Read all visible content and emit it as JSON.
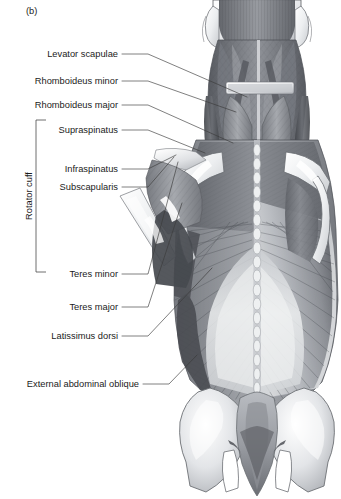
{
  "figure": {
    "panel_label": "(b)",
    "caption_region": "posterior view of superficial and deep back, shoulder and gluteal musculature",
    "background_color": "#ffffff",
    "ink_color": "#1b1b1b",
    "leader_color": "#3a3a3a"
  },
  "group_bracket": {
    "label": "Rotator cuff",
    "orientation": "vertical",
    "members": [
      "Supraspinatus",
      "Infraspinatus",
      "Subscapularis",
      "Teres minor"
    ]
  },
  "labels": [
    {
      "id": "levator-scapulae",
      "text": "Levator scapulae",
      "text_x": 118,
      "text_y": 57,
      "leader_from_x": 122,
      "leader_from_y": 54,
      "leader_to_x": 247,
      "leader_to_y": 97
    },
    {
      "id": "rhomboideus-minor",
      "text": "Rhomboideus minor",
      "text_x": 118,
      "text_y": 84,
      "leader_from_x": 122,
      "leader_from_y": 81,
      "leader_to_x": 236,
      "leader_to_y": 112
    },
    {
      "id": "rhomboideus-major",
      "text": "Rhomboideus major",
      "text_x": 118,
      "text_y": 108,
      "leader_from_x": 122,
      "leader_from_y": 105,
      "leader_to_x": 233,
      "leader_to_y": 143
    },
    {
      "id": "supraspinatus",
      "text": "Supraspinatus",
      "text_x": 118,
      "text_y": 133,
      "leader_from_x": 122,
      "leader_from_y": 130,
      "leader_to_x": 205,
      "leader_to_y": 153
    },
    {
      "id": "infraspinatus",
      "text": "Infraspinatus",
      "text_x": 118,
      "text_y": 172,
      "leader_from_x": 122,
      "leader_from_y": 169,
      "leader_to_x": 176,
      "leader_to_y": 155
    },
    {
      "id": "subscapularis",
      "text": "Subscapularis",
      "text_x": 118,
      "text_y": 190,
      "leader_from_x": 122,
      "leader_from_y": 187,
      "leader_to_x": 174,
      "leader_to_y": 157
    },
    {
      "id": "teres-minor",
      "text": "Teres minor",
      "text_x": 118,
      "text_y": 277,
      "leader_from_x": 122,
      "leader_from_y": 274,
      "leader_to_x": 178,
      "leader_to_y": 162
    },
    {
      "id": "teres-major",
      "text": "Teres major",
      "text_x": 118,
      "text_y": 310,
      "leader_from_x": 122,
      "leader_from_y": 307,
      "leader_to_x": 182,
      "leader_to_y": 203
    },
    {
      "id": "latissimus-dorsi",
      "text": "Latissimus dorsi",
      "text_x": 118,
      "text_y": 339,
      "leader_from_x": 122,
      "leader_from_y": 336,
      "leader_to_x": 212,
      "leader_to_y": 268
    },
    {
      "id": "external-abdominal-oblique",
      "text": "External abdominal oblique",
      "text_x": 139,
      "text_y": 387,
      "leader_from_x": 143,
      "leader_from_y": 384,
      "leader_to_x": 197,
      "leader_to_y": 355
    }
  ],
  "anatomy_structures": [
    {
      "id": "head-base",
      "name": "base of skull / occiput"
    },
    {
      "id": "neck-musculature",
      "name": "deep posterior neck muscles"
    },
    {
      "id": "spine-midline",
      "name": "vertebral spinous processes"
    },
    {
      "id": "scapula-left",
      "name": "left scapula with spine of scapula"
    },
    {
      "id": "scapula-right",
      "name": "right scapula with spine of scapula"
    },
    {
      "id": "humerus-cut",
      "name": "cut shaft of humerus"
    },
    {
      "id": "latissimus-sheet",
      "name": "latissimus dorsi muscle sheet"
    },
    {
      "id": "thoracolumbar-fascia",
      "name": "thoracolumbar fascia"
    },
    {
      "id": "pelvis-ilium-left",
      "name": "left ilium / iliac crest"
    },
    {
      "id": "pelvis-ilium-right",
      "name": "right ilium / iliac crest"
    },
    {
      "id": "sacrum",
      "name": "sacrum"
    },
    {
      "id": "gluteal-region",
      "name": "gluteal region"
    }
  ]
}
